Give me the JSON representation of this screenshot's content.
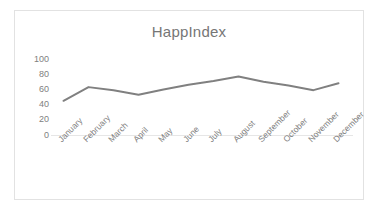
{
  "chart_data": {
    "type": "line",
    "title": "HappIndex",
    "xlabel": "",
    "ylabel": "",
    "categories": [
      "January",
      "February",
      "March",
      "April",
      "May",
      "June",
      "July",
      "August",
      "September",
      "October",
      "November",
      "December"
    ],
    "series": [
      {
        "name": "HappIndex",
        "values": [
          45,
          63,
          59,
          53,
          60,
          66,
          71,
          77,
          70,
          65,
          59,
          68
        ],
        "color": "#808080"
      }
    ],
    "ylim": [
      0,
      100
    ],
    "y_ticks": [
      100,
      80,
      60,
      40,
      20,
      0
    ],
    "grid": "baseline-only",
    "legend": "none",
    "markers": "none",
    "line_width": 2
  },
  "frame": {
    "border_color": "#e2e2e2",
    "background": "#ffffff"
  },
  "axis": {
    "tick_label_color": "#808080",
    "gridline_color": "#e6e6e6"
  }
}
